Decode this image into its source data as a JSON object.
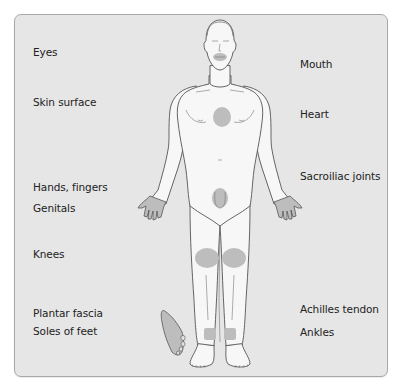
{
  "diagram": {
    "type": "anatomical-body-map",
    "highlight_color": "#bdbdbd",
    "panel_color": "#e6e6e6",
    "body_fill": "#f7f7f7",
    "outline_color": "#555555",
    "labels_left": [
      {
        "id": "eyes",
        "text": "Eyes"
      },
      {
        "id": "skin-surface",
        "text": "Skin surface"
      },
      {
        "id": "hands-fingers",
        "text": "Hands, fingers"
      },
      {
        "id": "genitals",
        "text": "Genitals"
      },
      {
        "id": "knees",
        "text": "Knees"
      },
      {
        "id": "plantar-fascia",
        "text": "Plantar fascia"
      },
      {
        "id": "soles-of-feet",
        "text": "Soles of feet"
      }
    ],
    "labels_right": [
      {
        "id": "mouth",
        "text": "Mouth"
      },
      {
        "id": "heart",
        "text": "Heart"
      },
      {
        "id": "sacroiliac-joints",
        "text": "Sacroiliac joints"
      },
      {
        "id": "achilles-tendon",
        "text": "Achilles tendon"
      },
      {
        "id": "ankles",
        "text": "Ankles"
      }
    ],
    "highlighted_regions": [
      "mouth",
      "heart",
      "hands",
      "genitals",
      "knees",
      "ankles",
      "sole-of-foot"
    ]
  }
}
